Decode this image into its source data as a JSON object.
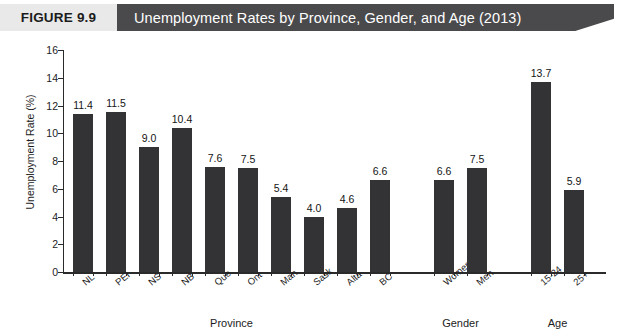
{
  "banner": {
    "figure_number": "FIGURE 9.9",
    "title": "Unemployment Rates by Province, Gender, and Age (2013)"
  },
  "chart_data": {
    "type": "bar",
    "title": "Unemployment Rates by Province, Gender, and Age (2013)",
    "xlabel": "",
    "ylabel": "Unemployment Rate (%)",
    "ylim": [
      0,
      16
    ],
    "ytick_step": 2,
    "yticks": [
      "0",
      "2",
      "4",
      "6",
      "8",
      "10",
      "12",
      "14",
      "16"
    ],
    "grid": false,
    "legend": "none",
    "bar_color": "#333335",
    "categories": [
      "NL",
      "PEI",
      "NS",
      "NB",
      "Que",
      "Ont",
      "Man",
      "Sask",
      "Alta",
      "BC",
      "Women",
      "Men",
      "15-24",
      "25+"
    ],
    "values": [
      11.4,
      11.5,
      9.0,
      10.4,
      7.6,
      7.5,
      5.4,
      4.0,
      4.6,
      6.6,
      6.6,
      7.5,
      13.7,
      5.9
    ],
    "value_labels": [
      "11.4",
      "11.5",
      "9.0",
      "10.4",
      "7.6",
      "7.5",
      "5.4",
      "4.0",
      "4.6",
      "6.6",
      "6.6",
      "7.5",
      "13.7",
      "5.9"
    ],
    "groups": [
      {
        "label": "Province",
        "categories": [
          "NL",
          "PEI",
          "NS",
          "NB",
          "Que",
          "Ont",
          "Man",
          "Sask",
          "Alta",
          "BC"
        ]
      },
      {
        "label": "Gender",
        "categories": [
          "Women",
          "Men"
        ]
      },
      {
        "label": "Age",
        "categories": [
          "15-24",
          "25+"
        ]
      }
    ],
    "group_labels": [
      "Province",
      "Gender",
      "Age"
    ]
  }
}
